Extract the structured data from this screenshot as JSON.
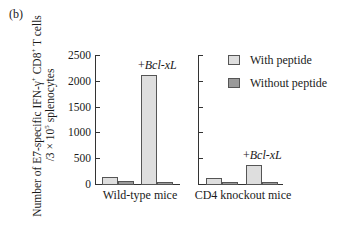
{
  "panel_label": "(b)",
  "chart_data": {
    "type": "bar",
    "title": "",
    "ylabel": "Number of E7-specific IFN-γ+ CD8+ T cells /3 × 10^5 splenocytes",
    "ylabel_line1_parts": [
      "Number of E7-specific IFN-",
      "γ",
      "+",
      " CD8",
      "+",
      " T cells"
    ],
    "ylabel_line2_parts": [
      "/3 × 10",
      "5",
      " splenocytes"
    ],
    "ylim": [
      0,
      2500
    ],
    "yticks": [
      0,
      500,
      1000,
      1500,
      2000,
      2500
    ],
    "grid": false,
    "legend_position": "upper right",
    "series": [
      {
        "name": "With peptide",
        "color": "#dedede"
      },
      {
        "name": "Without peptide",
        "color": "#9a9a9a"
      }
    ],
    "panels": [
      {
        "xlabel": "Wild-type mice",
        "groups": [
          {
            "condition": "control",
            "with_peptide": 130,
            "without_peptide": 50
          },
          {
            "condition": "+Bcl-xL",
            "with_peptide": 2120,
            "without_peptide": 40
          }
        ],
        "annotation": {
          "prefix": "+",
          "italic": "Bcl-xL"
        }
      },
      {
        "xlabel": "CD4 knockout mice",
        "groups": [
          {
            "condition": "control",
            "with_peptide": 120,
            "without_peptide": 40
          },
          {
            "condition": "+Bcl-xL",
            "with_peptide": 370,
            "without_peptide": 40
          }
        ],
        "annotation": {
          "prefix": "+",
          "italic": "Bcl-xL"
        }
      }
    ]
  }
}
